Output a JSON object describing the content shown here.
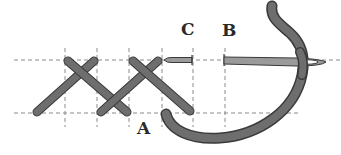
{
  "diagram": {
    "type": "embroidery-stitch-instruction",
    "labels": {
      "a": "A",
      "b": "B",
      "c": "C"
    },
    "grid": {
      "horizontal_lines_y": [
        60,
        113
      ],
      "vertical_lines_x": [
        65,
        97,
        129,
        162,
        193,
        225
      ],
      "line_style": "dashed"
    },
    "colors": {
      "thread": "#6e6e6e",
      "thread_outline": "#3a3a3a",
      "needle": "#9a9a9a",
      "grid": "#8a8a8a",
      "label": "#2a2a2a",
      "background": "#ffffff"
    },
    "elements": [
      "two completed crossed stitches",
      "needle passing from B to C",
      "thread looping from A up to needle eye"
    ]
  }
}
